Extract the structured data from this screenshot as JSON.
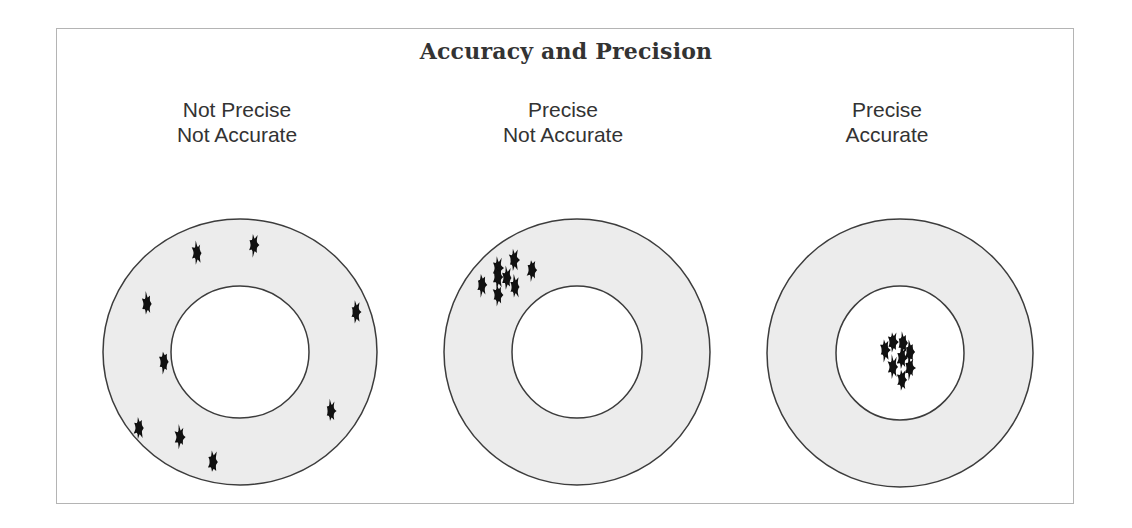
{
  "title": "Accuracy and Precision",
  "colors": {
    "ring_fill": "#ececec",
    "bullseye_fill": "#ffffff",
    "outline": "#3c3c3c",
    "hole": "#111111",
    "text": "#333333",
    "frame_border": "#b4b4b4"
  },
  "panels": [
    {
      "line1": "Not Precise",
      "line2": "Not Accurate",
      "label_center_x": 237,
      "target": {
        "cx": 240,
        "cy": 352,
        "outer_rx": 137,
        "outer_ry": 133,
        "inner_rx": 69,
        "inner_ry": 66
      },
      "holes": [
        [
          197,
          253
        ],
        [
          254,
          245
        ],
        [
          147,
          304
        ],
        [
          356,
          312
        ],
        [
          164,
          362
        ],
        [
          331,
          411
        ],
        [
          139,
          428
        ],
        [
          180,
          437
        ],
        [
          213,
          462
        ]
      ]
    },
    {
      "line1": "Precise",
      "line2": "Not Accurate",
      "label_center_x": 563,
      "target": {
        "cx": 577,
        "cy": 352,
        "outer_rx": 133,
        "outer_ry": 133,
        "inner_rx": 65,
        "inner_ry": 66
      },
      "holes": [
        [
          514,
          260
        ],
        [
          532,
          270
        ],
        [
          498,
          268
        ],
        [
          498,
          277
        ],
        [
          507,
          278
        ],
        [
          482,
          285
        ],
        [
          515,
          287
        ],
        [
          498,
          295
        ]
      ]
    },
    {
      "line1": "Precise",
      "line2": "Accurate",
      "label_center_x": 887,
      "target": {
        "cx": 900,
        "cy": 353,
        "outer_rx": 133,
        "outer_ry": 134,
        "inner_rx": 64,
        "inner_ry": 67
      },
      "holes": [
        [
          893,
          342
        ],
        [
          903,
          343
        ],
        [
          885,
          350
        ],
        [
          910,
          352
        ],
        [
          902,
          358
        ],
        [
          893,
          367
        ],
        [
          910,
          368
        ],
        [
          902,
          380
        ]
      ]
    }
  ]
}
